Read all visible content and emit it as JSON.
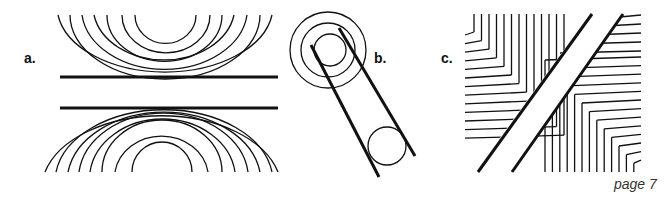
{
  "figure": {
    "panels": [
      {
        "label": "a.",
        "description": "Two horizontal parallel lines with concentric semicircular arcs above and below"
      },
      {
        "label": "b.",
        "description": "Two diagonal parallel lines with concentric circles at top and a single circle at bottom"
      },
      {
        "label": "c.",
        "description": "Diagonal band crossing chevron line patterns"
      }
    ],
    "page_number": "page 7",
    "colors": {
      "stroke": "#111111",
      "background": "#ffffff",
      "page_text": "#333333"
    }
  }
}
